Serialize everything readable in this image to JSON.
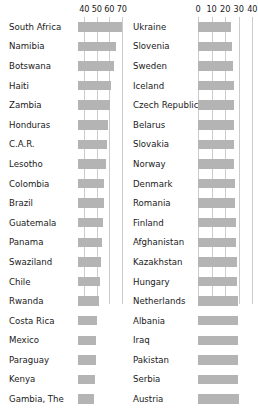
{
  "chart_data": [
    {
      "type": "bar",
      "panel": "left",
      "title": "",
      "xlabel": "",
      "ylabel": "",
      "orientation": "horizontal",
      "grid": true,
      "xlim": [
        35,
        75
      ],
      "ticks": [
        40,
        50,
        60,
        70
      ],
      "tick_labels": [
        "40",
        "50",
        "60",
        "70"
      ],
      "categories": [
        "South Africa",
        "Namibia",
        "Botswana",
        "Haiti",
        "Zambia",
        "Honduras",
        "C.A.R.",
        "Lesotho",
        "Colombia",
        "Brazil",
        "Guatemala",
        "Panama",
        "Swaziland",
        "Chile",
        "Rwanda",
        "Costa Rica",
        "Mexico",
        "Paraguay",
        "Kenya",
        "Gambia, The"
      ],
      "values": [
        70.0,
        65.0,
        63.5,
        61.5,
        60.5,
        59.0,
        58.0,
        57.0,
        56.0,
        55.5,
        55.0,
        54.5,
        53.5,
        52.5,
        51.5,
        50.5,
        49.5,
        49.0,
        48.5,
        47.5
      ]
    },
    {
      "type": "bar",
      "panel": "right",
      "title": "",
      "xlabel": "",
      "ylabel": "",
      "orientation": "horizontal",
      "grid": true,
      "xlim": [
        0,
        42
      ],
      "ticks": [
        0,
        10,
        20,
        30,
        40
      ],
      "tick_labels": [
        "0",
        "10",
        "20",
        "30",
        "40"
      ],
      "categories": [
        "Ukraine",
        "Slovenia",
        "Sweden",
        "Iceland",
        "Czech Republic",
        "Belarus",
        "Slovakia",
        "Norway",
        "Denmark",
        "Romania",
        "Finland",
        "Afghanistan",
        "Kazakhstan",
        "Hungary",
        "Netherlands",
        "Albania",
        "Iraq",
        "Pakistan",
        "Serbia",
        "Austria"
      ],
      "values": [
        24.6,
        24.9,
        26.1,
        26.3,
        26.4,
        26.5,
        26.6,
        26.8,
        27.0,
        27.4,
        27.8,
        27.8,
        28.6,
        28.9,
        29.2,
        29.4,
        29.5,
        29.6,
        29.7,
        30.5
      ]
    }
  ],
  "left_axis": {
    "ticks": [
      "40",
      "50",
      "60",
      "70"
    ]
  },
  "right_axis": {
    "ticks": [
      "0",
      "10",
      "20",
      "30",
      "40"
    ]
  }
}
